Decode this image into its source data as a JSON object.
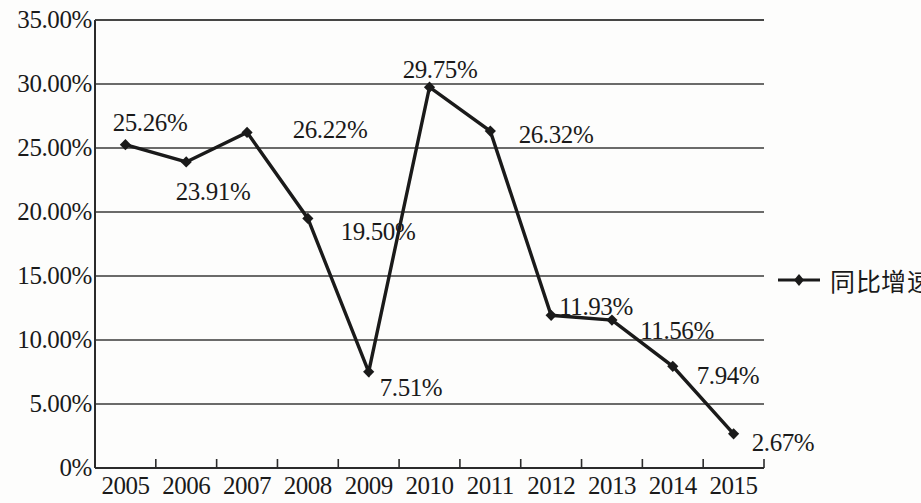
{
  "chart_data": {
    "type": "line",
    "title": "",
    "subtitle": "",
    "xlabel": "",
    "ylabel": "",
    "categories": [
      "2005",
      "2006",
      "2007",
      "2008",
      "2009",
      "2010",
      "2011",
      "2012",
      "2013",
      "2014",
      "2015"
    ],
    "series": [
      {
        "name": "同比增速",
        "values": [
          25.26,
          23.91,
          26.22,
          19.5,
          7.51,
          29.75,
          26.32,
          11.93,
          11.56,
          7.94,
          2.67
        ],
        "point_labels": [
          "25.26%",
          "23.91%",
          "26.22%",
          "19.50%",
          "7.51%",
          "29.75%",
          "26.32%",
          "11.93%",
          "11.56%",
          "7.94%",
          "2.67%"
        ],
        "color": "#1a1a1a",
        "marker": "diamond"
      }
    ],
    "ylim": [
      0,
      35
    ],
    "ytick_values": [
      0,
      5,
      10,
      15,
      20,
      25,
      30,
      35
    ],
    "ytick_labels": [
      "0%",
      "5.00%",
      "10.00%",
      "15.00%",
      "20.00%",
      "25.00%",
      "30.00%",
      "35.00%"
    ],
    "grid": true,
    "grid_axis": "y",
    "legend_position": "right",
    "legend_entries": [
      "同比增速"
    ],
    "colors": {
      "line": "#1a1a1a",
      "grid": "#3a3a3a",
      "axis": "#2b2b2b",
      "text": "#1a1a1a",
      "background": "#fdfdfc"
    }
  },
  "label_offsets": [
    {
      "label": "25.26%",
      "x": 150,
      "y": 123
    },
    {
      "label": "23.91%",
      "x": 213,
      "y": 192
    },
    {
      "label": "26.22%",
      "x": 330,
      "y": 130
    },
    {
      "label": "19.50%",
      "x": 378,
      "y": 232
    },
    {
      "label": "7.51%",
      "x": 411,
      "y": 388
    },
    {
      "label": "29.75%",
      "x": 440,
      "y": 70
    },
    {
      "label": "26.32%",
      "x": 556,
      "y": 135
    },
    {
      "label": "11.93%",
      "x": 596,
      "y": 307
    },
    {
      "label": "11.56%",
      "x": 677,
      "y": 331
    },
    {
      "label": "7.94%",
      "x": 728,
      "y": 376
    },
    {
      "label": "2.67%",
      "x": 783,
      "y": 443
    }
  ]
}
